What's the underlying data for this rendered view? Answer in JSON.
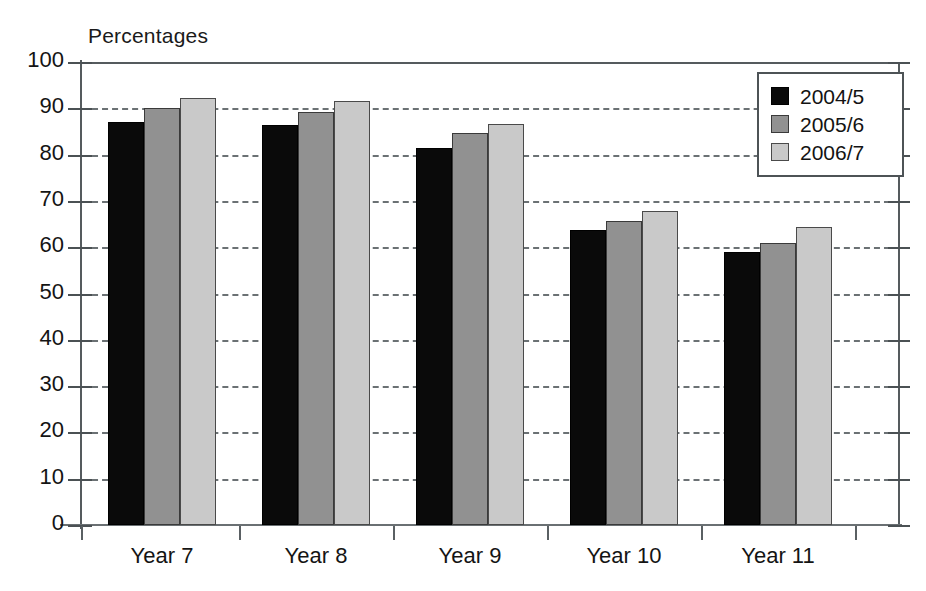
{
  "chart_data": {
    "type": "bar",
    "title": "",
    "subtitle": "",
    "xlabel": "",
    "ylabel": "Percentages",
    "ylim": [
      0,
      100
    ],
    "ytick_step": 10,
    "yticks": [
      0,
      10,
      20,
      30,
      40,
      50,
      60,
      70,
      80,
      90,
      100
    ],
    "ytick_labels": [
      "0",
      "10",
      "20",
      "30",
      "40",
      "50",
      "60",
      "70",
      "80",
      "90",
      "100"
    ],
    "grid": "horizontal-dashed",
    "legend_position": "top-right",
    "categories": [
      "Year 7",
      "Year 8",
      "Year 9",
      "Year 10",
      "Year 11"
    ],
    "series": [
      {
        "name": "2004/5",
        "color": "#0a0a0a",
        "values": [
          87.0,
          86.3,
          81.5,
          63.8,
          58.9
        ]
      },
      {
        "name": "2005/6",
        "color": "#919191",
        "values": [
          90.0,
          89.2,
          84.7,
          65.7,
          61.0
        ]
      },
      {
        "name": "2006/7",
        "color": "#c9c9c9",
        "values": [
          92.3,
          91.5,
          86.6,
          67.8,
          64.3
        ]
      }
    ]
  },
  "legend": {
    "items": [
      {
        "label": "2004/5",
        "swatch": "legend-swatch-black"
      },
      {
        "label": "2005/6",
        "swatch": "legend-swatch-gray"
      },
      {
        "label": "2006/7",
        "swatch": "legend-swatch-light-gray"
      }
    ]
  },
  "colors": {
    "series_2004_5": "#0a0a0a",
    "series_2005_6": "#919191",
    "series_2006_7": "#c9c9c9",
    "axis": "#555b5e",
    "gridline": "#6b7174",
    "text": "#141414",
    "background": "#ffffff"
  }
}
